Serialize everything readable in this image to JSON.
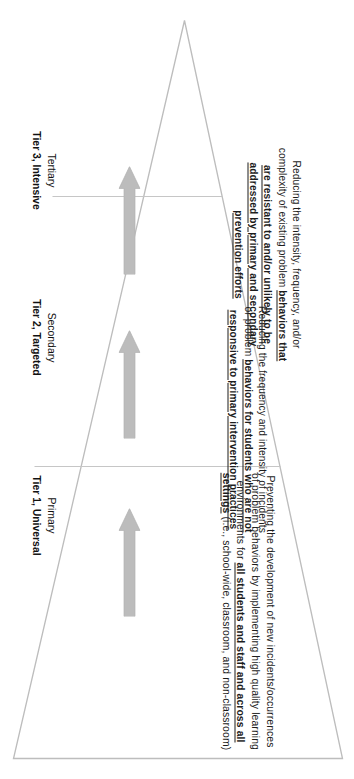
{
  "diagram": {
    "name": "multi-tiered-system-of-supports-triangle",
    "orientation": "rotated-90-degrees",
    "outline_color": "#b9b9b9",
    "arrow_color": "#bcbcbc",
    "background_color": "#ffffff"
  },
  "tiers": [
    {
      "id": "tier3",
      "label_lead": "Tertiary",
      "label_strong": "Tier 3, Intensive",
      "arrow_icon": "up-arrow-icon",
      "description_parts": [
        {
          "text": "Reducing the intensity, frequency, and/or complexity of existing problem ",
          "emphasis": false
        },
        {
          "text": "behaviors that are resistant to and/or unlikely to be addressed by primary and secondary prevention efforts",
          "emphasis": true
        }
      ],
      "description_plain": "Reducing the intensity, frequency, and/or complexity of existing problem behaviors that are resistant to and/or unlikely to be addressed by primary and secondary prevention efforts"
    },
    {
      "id": "tier2",
      "label_lead": "Secondary",
      "label_strong": "Tier 2, Targeted",
      "arrow_icon": "up-arrow-icon",
      "description_parts": [
        {
          "text": "Reducing the frequency and intensity of incidents or problem ",
          "emphasis": false
        },
        {
          "text": "behaviors for students who are not responsive to primary intervention practices",
          "emphasis": true
        }
      ],
      "description_plain": "Reducing the frequency and intensity of incidents or problem behaviors for students who are not responsive to primary intervention practices"
    },
    {
      "id": "tier1",
      "label_lead": "Primary",
      "label_strong": "Tier 1, Universal",
      "arrow_icon": "up-arrow-icon",
      "description_parts": [
        {
          "text": "Preventing the development of new incidents/occurrences of problem behaviors by implementing high quality learning environments for ",
          "emphasis": false
        },
        {
          "text": "all students and staff and across all settings",
          "emphasis": true
        },
        {
          "text": " (i.e., school-wide, classroom, and non-classroom)",
          "emphasis": false
        }
      ],
      "description_plain": "Preventing the development of new incidents/occurrences of problem behaviors by implementing high quality learning environments for all students and staff and across all settings (i.e., school-wide, classroom, and non-classroom)"
    }
  ]
}
